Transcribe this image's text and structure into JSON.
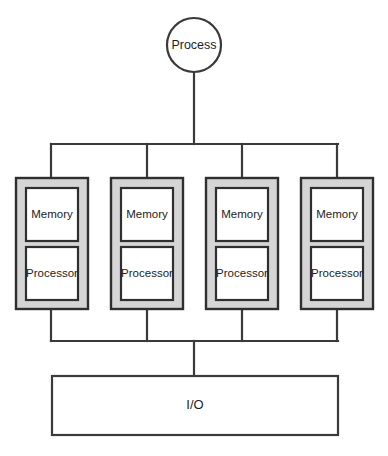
{
  "diagram": {
    "title": "Process",
    "type": "block-diagram",
    "colors": {
      "background": "#ffffff",
      "line": "#3a3a3a",
      "module_fill": "#d5d5d5",
      "cell_fill": "#ffffff",
      "text": "#1c1c1c"
    },
    "process_node": {
      "label": "Process",
      "shape": "circle",
      "cx": 194,
      "cy": 45,
      "r": 27
    },
    "trunk": {
      "from_y": 72,
      "to_y": 144,
      "x": 194
    },
    "top_bus": {
      "y": 144,
      "x_start": 51,
      "x_end": 338
    },
    "bottom_bus": {
      "y": 341,
      "x_start": 51,
      "x_end": 338
    },
    "io_stem": {
      "x": 194,
      "from_y": 341,
      "to_y": 376
    },
    "modules": [
      {
        "id": "module-1",
        "x": 16,
        "y": 178,
        "width": 72,
        "height": 131,
        "connector_x": 51,
        "cells": [
          {
            "label": "Memory"
          },
          {
            "label": "Processor"
          }
        ]
      },
      {
        "id": "module-2",
        "x": 111,
        "y": 178,
        "width": 72,
        "height": 131,
        "connector_x": 147,
        "cells": [
          {
            "label": "Memory"
          },
          {
            "label": "Processor"
          }
        ]
      },
      {
        "id": "module-3",
        "x": 206,
        "y": 178,
        "width": 72,
        "height": 131,
        "connector_x": 242,
        "cells": [
          {
            "label": "Memory"
          },
          {
            "label": "Processor"
          }
        ]
      },
      {
        "id": "module-4",
        "x": 301,
        "y": 178,
        "width": 72,
        "height": 131,
        "connector_x": 337,
        "cells": [
          {
            "label": "Memory"
          },
          {
            "label": "Processor"
          }
        ]
      }
    ],
    "io_node": {
      "label": "I/O",
      "x": 52,
      "y": 376,
      "width": 286,
      "height": 59
    }
  }
}
